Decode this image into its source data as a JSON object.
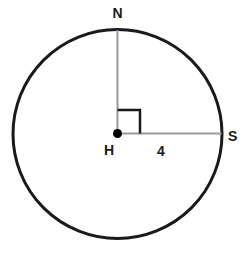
{
  "diagram": {
    "type": "circle-geometry-figure",
    "labels": {
      "top_point": "N",
      "right_point": "S",
      "center_point": "H",
      "radius_value": "4"
    },
    "colors": {
      "circle_stroke": "#1a1a1a",
      "radius_line": "#999999",
      "right_angle_marker": "#1a1a1a",
      "center_dot": "#000000",
      "label_text": "#1a1a1a",
      "background": "#ffffff"
    }
  }
}
